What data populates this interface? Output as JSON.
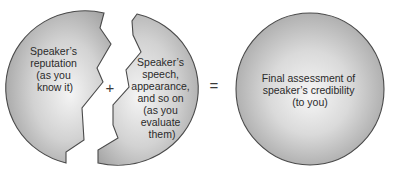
{
  "diagram": {
    "type": "credibility-equation",
    "left_piece": {
      "lines": [
        "Speaker’s",
        "reputation",
        "(as you",
        "know it)"
      ]
    },
    "plus_operator": "+",
    "right_piece": {
      "lines": [
        "Speaker’s",
        "speech,",
        "appearance,",
        "and so on",
        "(as you",
        "evaluate",
        "them)"
      ]
    },
    "equals_operator": "=",
    "result_circle": {
      "lines": [
        "Final assessment of",
        "speaker’s credibility",
        "(to you)"
      ]
    },
    "colors": {
      "fill_center": "#f2f2f2",
      "fill_edge": "#a6a6a6",
      "outline": "#4a4a4a",
      "text": "#2a2a2a",
      "background": "#ffffff"
    }
  }
}
